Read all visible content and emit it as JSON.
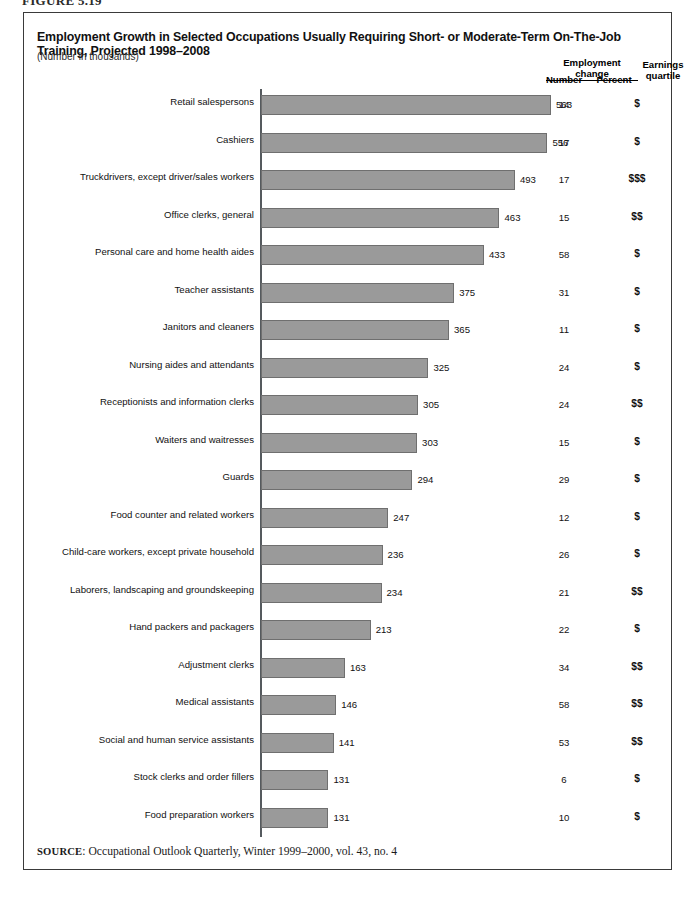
{
  "figure": {
    "number_label": "FIGURE 5.19"
  },
  "chart_title": "Employment Growth in Selected Occupations Usually Requiring Short- or Moderate-Term On-The-Job Training, Projected 1998–2008",
  "chart_subtitle": "(Number in thousands)",
  "columns": {
    "group_header": "Employment change",
    "number": "Number",
    "percent": "Percent",
    "earnings_quartile": "Earnings quartile"
  },
  "source": {
    "label": "SOURCE",
    "text": ": Occupational Outlook Quarterly, Winter 1999–2000, vol. 43, no. 4"
  },
  "colors": {
    "bar_fill": "#9a9a9a",
    "bar_stroke": "#6f6f6f",
    "axis": "#555a5e",
    "frame": "#3a3a3a",
    "text": "#111111"
  },
  "chart_data": {
    "type": "bar",
    "orientation": "horizontal",
    "title": "Employment Growth in Selected Occupations Usually Requiring Short- or Moderate-Term On-The-Job Training, Projected 1998–2008",
    "subtitle": "(Number in thousands)",
    "xlabel": "",
    "ylabel": "",
    "xlim": [
      0,
      563
    ],
    "grid": false,
    "legend": null,
    "categories": [
      "Retail salespersons",
      "Cashiers",
      "Truckdrivers, except driver/sales workers",
      "Office clerks, general",
      "Personal care and home health aides",
      "Teacher assistants",
      "Janitors and cleaners",
      "Nursing aides and attendants",
      "Receptionists and information clerks",
      "Waiters and waitresses",
      "Guards",
      "Food counter and related workers",
      "Child-care workers, except private household",
      "Laborers, landscaping and groundskeeping",
      "Hand packers and packagers",
      "Adjustment clerks",
      "Medical assistants",
      "Social and human service assistants",
      "Stock clerks and order fillers",
      "Food preparation workers"
    ],
    "values": [
      563,
      556,
      493,
      463,
      433,
      375,
      365,
      325,
      305,
      303,
      294,
      247,
      236,
      234,
      213,
      163,
      146,
      141,
      131,
      131
    ],
    "percent_change": [
      14,
      17,
      17,
      15,
      58,
      31,
      11,
      24,
      24,
      15,
      29,
      12,
      26,
      21,
      22,
      34,
      58,
      53,
      6,
      10
    ],
    "earnings_quartile": [
      "$",
      "$",
      "$$$",
      "$$",
      "$",
      "$",
      "$",
      "$",
      "$$",
      "$",
      "$",
      "$",
      "$",
      "$$",
      "$",
      "$$",
      "$$",
      "$$",
      "$",
      "$"
    ]
  }
}
